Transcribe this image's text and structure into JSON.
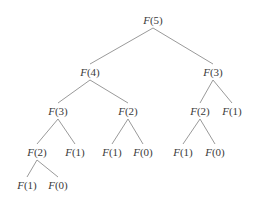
{
  "diagram": {
    "title": "",
    "type": "recursion-tree",
    "edge_color": "#9a9a9a",
    "nodes": [
      {
        "id": "n0",
        "fn": "F",
        "arg": "(5)",
        "x": 153,
        "y": 20
      },
      {
        "id": "n1",
        "fn": "F",
        "arg": "(4)",
        "x": 90,
        "y": 72
      },
      {
        "id": "n2",
        "fn": "F",
        "arg": "(3)",
        "x": 213,
        "y": 72
      },
      {
        "id": "n3",
        "fn": "F",
        "arg": "(3)",
        "x": 58,
        "y": 111
      },
      {
        "id": "n4",
        "fn": "F",
        "arg": "(2)",
        "x": 128,
        "y": 111
      },
      {
        "id": "n5",
        "fn": "F",
        "arg": "(2)",
        "x": 200,
        "y": 111
      },
      {
        "id": "n6",
        "fn": "F",
        "arg": "(1)",
        "x": 232,
        "y": 111
      },
      {
        "id": "n7",
        "fn": "F",
        "arg": "(2)",
        "x": 37,
        "y": 152
      },
      {
        "id": "n8",
        "fn": "F",
        "arg": "(1)",
        "x": 75,
        "y": 152
      },
      {
        "id": "n9",
        "fn": "F",
        "arg": "(1)",
        "x": 112,
        "y": 152
      },
      {
        "id": "n10",
        "fn": "F",
        "arg": "(0)",
        "x": 143,
        "y": 152
      },
      {
        "id": "n11",
        "fn": "F",
        "arg": "(1)",
        "x": 183,
        "y": 152
      },
      {
        "id": "n12",
        "fn": "F",
        "arg": "(0)",
        "x": 215,
        "y": 152
      },
      {
        "id": "n13",
        "fn": "F",
        "arg": "(1)",
        "x": 27,
        "y": 185
      },
      {
        "id": "n14",
        "fn": "F",
        "arg": "(0)",
        "x": 58,
        "y": 185
      }
    ],
    "edges": [
      {
        "from": "n0",
        "to": "n1"
      },
      {
        "from": "n0",
        "to": "n2"
      },
      {
        "from": "n1",
        "to": "n3"
      },
      {
        "from": "n1",
        "to": "n4"
      },
      {
        "from": "n2",
        "to": "n5"
      },
      {
        "from": "n2",
        "to": "n6"
      },
      {
        "from": "n3",
        "to": "n7"
      },
      {
        "from": "n3",
        "to": "n8"
      },
      {
        "from": "n4",
        "to": "n9"
      },
      {
        "from": "n4",
        "to": "n10"
      },
      {
        "from": "n5",
        "to": "n11"
      },
      {
        "from": "n5",
        "to": "n12"
      },
      {
        "from": "n7",
        "to": "n13"
      },
      {
        "from": "n7",
        "to": "n14"
      }
    ]
  }
}
